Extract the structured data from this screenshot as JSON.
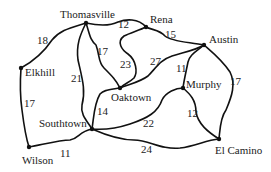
{
  "nodes": [
    {
      "id": "thomasville",
      "label": "Thomasville",
      "x": 86,
      "y": 23
    },
    {
      "id": "rena",
      "label": "Rena",
      "x": 146,
      "y": 27
    },
    {
      "id": "austin",
      "label": "Austin",
      "x": 204,
      "y": 45
    },
    {
      "id": "elkhill",
      "label": "Elkhill",
      "x": 21,
      "y": 68
    },
    {
      "id": "oaktown",
      "label": "Oaktown",
      "x": 120,
      "y": 88
    },
    {
      "id": "murphy",
      "label": "Murphy",
      "x": 183,
      "y": 88
    },
    {
      "id": "southtown",
      "label": "Southtown",
      "x": 92,
      "y": 129
    },
    {
      "id": "wilson",
      "label": "Wilson",
      "x": 29,
      "y": 147
    },
    {
      "id": "elcamino",
      "label": "El Camino",
      "x": 219,
      "y": 139
    }
  ],
  "edges": [
    {
      "from": "thomasville",
      "to": "rena",
      "weight": "12"
    },
    {
      "from": "rena",
      "to": "austin",
      "weight": "15"
    },
    {
      "from": "thomasville",
      "to": "elkhill",
      "weight": "18"
    },
    {
      "from": "thomasville",
      "to": "oaktown",
      "weight": "17"
    },
    {
      "from": "thomasville",
      "to": "southtown",
      "weight": "21"
    },
    {
      "from": "rena",
      "to": "oaktown",
      "weight": "23"
    },
    {
      "from": "oaktown",
      "to": "austin",
      "weight": "27"
    },
    {
      "from": "austin",
      "to": "murphy",
      "weight": "11"
    },
    {
      "from": "austin",
      "to": "elcamino",
      "weight": "17"
    },
    {
      "from": "elkhill",
      "to": "wilson",
      "weight": "17"
    },
    {
      "from": "oaktown",
      "to": "southtown",
      "weight": "14"
    },
    {
      "from": "southtown",
      "to": "murphy",
      "weight": "22"
    },
    {
      "from": "murphy",
      "to": "elcamino",
      "weight": "12"
    },
    {
      "from": "wilson",
      "to": "southtown",
      "weight": "11"
    },
    {
      "from": "southtown",
      "to": "elcamino",
      "weight": "24"
    }
  ],
  "labels": {
    "thomasville": "Thomasville",
    "rena": "Rena",
    "austin": "Austin",
    "elkhill": "Elkhill",
    "oaktown": "Oaktown",
    "murphy": "Murphy",
    "southtown": "Southtown",
    "wilson": "Wilson",
    "elcamino": "El Camino"
  },
  "weights": {
    "t_r": "12",
    "r_a": "15",
    "t_e": "18",
    "t_o": "17",
    "t_s": "21",
    "r_o": "23",
    "o_a": "27",
    "a_m": "11",
    "a_ec": "17",
    "e_w": "17",
    "o_s": "14",
    "s_m": "22",
    "m_ec": "12",
    "w_s": "11",
    "s_ec": "24"
  }
}
